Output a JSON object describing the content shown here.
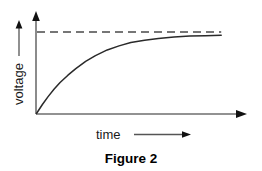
{
  "figure": {
    "caption": "Figure 2",
    "y_axis_label": "voltage",
    "x_axis_label": "time",
    "y_axis_arrow_icon": "arrow-up-icon",
    "x_axis_arrow_icon": "arrow-right-icon",
    "asymptote_icon": "dashed-line-icon",
    "colors": {
      "background": "#ffffff",
      "axis": "#6e6e6e",
      "curve": "#2a2a2a",
      "asymptote": "#4a4a4a",
      "text": "#000000"
    }
  },
  "chart_data": {
    "type": "line",
    "title": "Figure 2",
    "xlabel": "time",
    "ylabel": "voltage",
    "grid": false,
    "legend": null,
    "xlim": [
      0,
      1
    ],
    "ylim": [
      0,
      1.12
    ],
    "axis_tick_labels": {
      "x": [],
      "y": []
    },
    "annotations": [
      {
        "text": "",
        "kind": "asymptote",
        "style": "dashed",
        "y": 1.0,
        "x_start": 0.0,
        "x_end": 0.94
      }
    ],
    "series": [
      {
        "name": "voltage",
        "description": "exponential saturation (capacitor charging) curve approaching asymptote",
        "x": [
          0.0,
          0.03,
          0.06,
          0.09,
          0.12,
          0.16,
          0.2,
          0.25,
          0.3,
          0.36,
          0.42,
          0.48,
          0.55,
          0.62,
          0.7,
          0.78,
          0.86,
          0.94
        ],
        "y": [
          0.0,
          0.11,
          0.21,
          0.3,
          0.38,
          0.47,
          0.55,
          0.64,
          0.71,
          0.78,
          0.83,
          0.87,
          0.9,
          0.92,
          0.94,
          0.95,
          0.955,
          0.96
        ]
      }
    ]
  }
}
